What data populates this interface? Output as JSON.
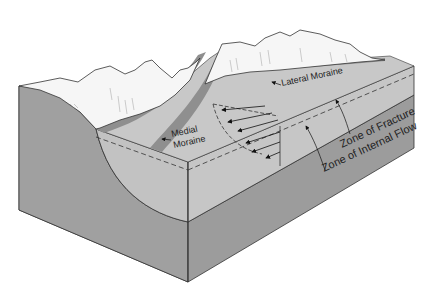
{
  "labels": {
    "lateral_moraine": "Lateral Moraine",
    "medial_moraine_line1": "Medial",
    "medial_moraine_line2": "Moraine",
    "zone_of_fracture": "Zone of Fracture",
    "zone_of_internal_flow": "Zone of Internal Flow"
  },
  "colors": {
    "bedrock": "#9a9a9a",
    "bedrock_side": "#a6a6a6",
    "ice_surface": "#c4c4c4",
    "ice_front": "#bcbcbc",
    "moraine_band": "#8e8e8e",
    "mountain": "#f6f6f6",
    "outline": "#333333"
  },
  "flow_arrows_count": 6
}
